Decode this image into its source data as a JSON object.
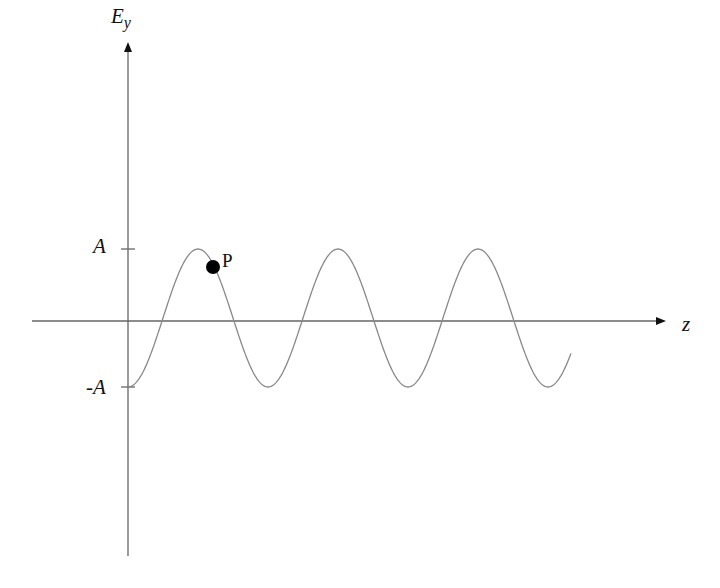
{
  "diagram": {
    "y_axis_label": "E",
    "y_axis_subscript": "y",
    "x_axis_label": "z",
    "tick_upper_label": "A",
    "tick_lower_label": "-A",
    "point_label": "P",
    "colors": {
      "axis": "#666666",
      "curve": "#888888",
      "point": "#000000",
      "text": "#111111"
    },
    "wave": {
      "type": "sinusoid",
      "start": "minimum at origin",
      "visible_peaks": 3,
      "visible_troughs": 4
    }
  }
}
